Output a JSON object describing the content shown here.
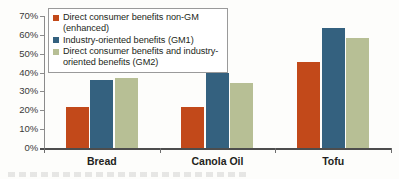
{
  "chart_data": {
    "type": "bar",
    "title": "",
    "xlabel": "",
    "ylabel": "",
    "categories": [
      "Bread",
      "Canola Oil",
      "Tofu"
    ],
    "series": [
      {
        "name": "Direct consumer benefits non-GM (enhanced)",
        "color": "#c2491a",
        "values": [
          22,
          22,
          45.5
        ]
      },
      {
        "name": "Industry-oriented benefits (GM1)",
        "color": "#34617f",
        "values": [
          36,
          40,
          63.5
        ]
      },
      {
        "name": "Direct consumer benefits and industry-oriented benefits (GM2)",
        "color": "#b7bf95",
        "values": [
          37,
          34.5,
          58.5
        ]
      }
    ],
    "ylim": [
      0,
      70
    ],
    "ytick_values": [
      70,
      60,
      50,
      40,
      30,
      20,
      10,
      0
    ],
    "ytick_labels": [
      "70%",
      "60%",
      "50%",
      "40%",
      "30%",
      "20%",
      "10%",
      "0%"
    ],
    "grid": false,
    "legend_position": "top-left",
    "legend_entries": [
      "Direct consumer benefits non-GM (enhanced)",
      "Industry-oriented benefits (GM1)",
      "Direct consumer benefits and industry-\noriented benefits (GM2)"
    ]
  },
  "colors": {
    "series_1": "#c2491a",
    "series_2": "#34617f",
    "series_3": "#b7bf95",
    "axis": "#4d4d4d",
    "text": "#231f20",
    "background": "#fdfdfb"
  }
}
